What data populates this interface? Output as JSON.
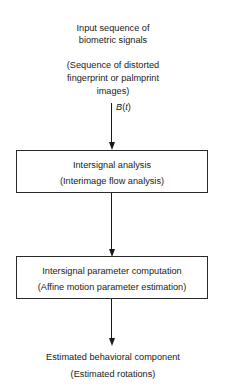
{
  "diagram": {
    "type": "flowchart",
    "input": {
      "line1": "Input sequence of",
      "line2": "biometric signals",
      "sub1": "(Sequence of distorted",
      "sub2": "fingerprint or palmprint",
      "sub3": "images)"
    },
    "edge_label": {
      "var": "B",
      "open": "(",
      "arg": "t",
      "close": ")"
    },
    "box1": {
      "title": "Intersignal analysis",
      "subtitle": "(Interimage flow analysis)"
    },
    "box2": {
      "title": "Intersignal parameter computation",
      "subtitle": "(Affine motion parameter estimation)"
    },
    "output": {
      "title": "Estimated behavioral component",
      "subtitle": "(Estimated rotations)"
    }
  }
}
